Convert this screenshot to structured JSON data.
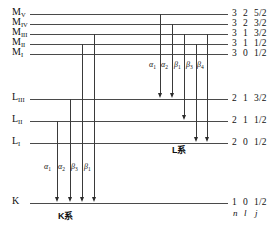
{
  "diagram": {
    "quantum_header": {
      "n": "n",
      "l": "l",
      "j": "j"
    },
    "levels": [
      {
        "id": "M5",
        "label": "M",
        "sub": "V",
        "n": "3",
        "l": "2",
        "j": "5/2",
        "y": 14,
        "x1": 30,
        "x2": 228
      },
      {
        "id": "M4",
        "label": "M",
        "sub": "IV",
        "n": "3",
        "l": "2",
        "j": "3/2",
        "y": 24,
        "x1": 30,
        "x2": 228
      },
      {
        "id": "M3",
        "label": "M",
        "sub": "III",
        "n": "3",
        "l": "1",
        "j": "3/2",
        "y": 34,
        "x1": 30,
        "x2": 228
      },
      {
        "id": "M2",
        "label": "M",
        "sub": "II",
        "n": "3",
        "l": "1",
        "j": "1/2",
        "y": 44,
        "x1": 30,
        "x2": 228
      },
      {
        "id": "M1",
        "label": "M",
        "sub": "I",
        "n": "3",
        "l": "0",
        "j": "1/2",
        "y": 54,
        "x1": 30,
        "x2": 228
      },
      {
        "id": "L3",
        "label": "L",
        "sub": "III",
        "n": "2",
        "l": "1",
        "j": "3/2",
        "y": 99,
        "x1": 30,
        "x2": 228
      },
      {
        "id": "L2",
        "label": "L",
        "sub": "II",
        "n": "2",
        "l": "1",
        "j": "1/2",
        "y": 121,
        "x1": 30,
        "x2": 228
      },
      {
        "id": "L1",
        "label": "L",
        "sub": "I",
        "n": "2",
        "l": "0",
        "j": "1/2",
        "y": 143,
        "x1": 30,
        "x2": 228
      },
      {
        "id": "K",
        "label": "K",
        "sub": "",
        "n": "1",
        "l": "0",
        "j": "1/2",
        "y": 203,
        "x1": 30,
        "x2": 228
      }
    ],
    "series": [
      {
        "id": "k-series",
        "label": "K系",
        "x": 58,
        "y": 212
      },
      {
        "id": "l-series",
        "label": "L系",
        "x": 172,
        "y": 146
      }
    ],
    "k_transitions": [
      {
        "id": "k-a1",
        "greek": "α",
        "sub": "1",
        "x": 57,
        "y_top": 121,
        "y_bottom": 203,
        "label_x": 44,
        "label_y": 163
      },
      {
        "id": "k-a2",
        "greek": "α",
        "sub": "2",
        "x": 70,
        "y_top": 99,
        "y_bottom": 203,
        "label_x": 58,
        "label_y": 163
      },
      {
        "id": "k-b3",
        "greek": "β",
        "sub": "3",
        "x": 82,
        "y_top": 44,
        "y_bottom": 203,
        "label_x": 71,
        "label_y": 163
      },
      {
        "id": "k-b1",
        "greek": "β",
        "sub": "1",
        "x": 94,
        "y_top": 34,
        "y_bottom": 203,
        "label_x": 84,
        "label_y": 163
      }
    ],
    "l_transitions": [
      {
        "id": "l-a1",
        "greek": "α",
        "sub": "1",
        "x": 160,
        "y_top": 14,
        "y_bottom": 99,
        "label_x": 149,
        "label_y": 61
      },
      {
        "id": "l-a2",
        "greek": "α",
        "sub": "2",
        "x": 172,
        "y_top": 24,
        "y_bottom": 99,
        "label_x": 161,
        "label_y": 61
      },
      {
        "id": "l-b1",
        "greek": "β",
        "sub": "1",
        "x": 184,
        "y_top": 34,
        "y_bottom": 121,
        "label_x": 174,
        "label_y": 61
      },
      {
        "id": "l-b3",
        "greek": "β",
        "sub": "3",
        "x": 196,
        "y_top": 44,
        "y_bottom": 143,
        "label_x": 186,
        "label_y": 61
      },
      {
        "id": "l-b4",
        "greek": "β",
        "sub": "4",
        "x": 207,
        "y_top": 34,
        "y_bottom": 143,
        "label_x": 197,
        "label_y": 61
      }
    ]
  }
}
